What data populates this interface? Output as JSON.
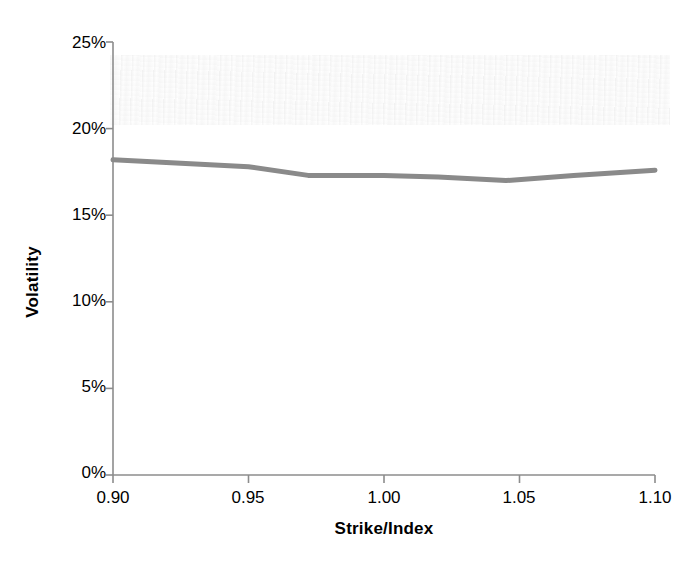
{
  "chart_data": {
    "type": "line",
    "title": "",
    "xlabel": "Strike/Index",
    "ylabel": "Volatility",
    "xlim": [
      0.9,
      1.1
    ],
    "ylim": [
      0,
      25
    ],
    "grid": false,
    "legend": "none",
    "x_tick_labels": [
      "0.90",
      "0.95",
      "1.00",
      "1.05",
      "1.10"
    ],
    "x_ticks": [
      0.9,
      0.95,
      1.0,
      1.05,
      1.1
    ],
    "y_tick_labels": [
      "0%",
      "5%",
      "10%",
      "15%",
      "20%",
      "25%"
    ],
    "y_ticks": [
      0,
      5,
      10,
      15,
      20,
      25
    ],
    "y_unit": "%",
    "series": [
      {
        "name": "Implied volatility smile",
        "color": "#8a8a8a",
        "line_width_px": 5,
        "x": [
          0.9,
          0.925,
          0.95,
          0.972,
          1.0,
          1.02,
          1.045,
          1.07,
          1.1
        ],
        "values": [
          18.2,
          18.0,
          17.8,
          17.3,
          17.3,
          17.2,
          17.0,
          17.3,
          17.6
        ]
      }
    ]
  },
  "axes": {
    "y_axis_line_color": "#8c8c8c",
    "x_axis_line_color": "#8c8c8c",
    "tick_color": "#8c8c8c"
  }
}
